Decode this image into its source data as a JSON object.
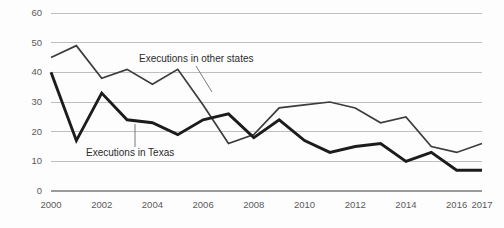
{
  "chart_data": {
    "type": "line",
    "title": "",
    "xlabel": "",
    "ylabel": "",
    "x": [
      2000,
      2001,
      2002,
      2003,
      2004,
      2005,
      2006,
      2007,
      2008,
      2009,
      2010,
      2011,
      2012,
      2013,
      2014,
      2015,
      2016,
      2017
    ],
    "xtick_labels": [
      "2000",
      "2002",
      "2004",
      "2006",
      "2008",
      "2010",
      "2012",
      "2014",
      "2016",
      "2017"
    ],
    "xtick_values": [
      2000,
      2002,
      2004,
      2006,
      2008,
      2010,
      2012,
      2014,
      2016,
      2017
    ],
    "ytick_labels": [
      "0",
      "10",
      "20",
      "30",
      "40",
      "50",
      "60"
    ],
    "ytick_values": [
      0,
      10,
      20,
      30,
      40,
      50,
      60
    ],
    "ylim": [
      0,
      60
    ],
    "xlim": [
      2000,
      2017
    ],
    "grid": true,
    "legend_position": "inline-annotations",
    "series": [
      {
        "name": "Executions in Texas",
        "color": "#1c1c1c",
        "line_width": "thick",
        "values": [
          40,
          17,
          33,
          24,
          23,
          19,
          24,
          26,
          18,
          24,
          17,
          13,
          15,
          16,
          10,
          13,
          7,
          7
        ]
      },
      {
        "name": "Executions in other states",
        "color": "#3c3c3c",
        "line_width": "thin",
        "values": [
          45,
          49,
          38,
          41,
          36,
          41,
          29,
          16,
          19,
          28,
          29,
          30,
          28,
          23,
          25,
          15,
          13,
          16
        ]
      }
    ],
    "annotations": [
      {
        "text": "Executions in other states",
        "target_year": 2006,
        "target_value": 36
      },
      {
        "text": "Executions in Texas",
        "target_year": 2004,
        "target_value": 23
      }
    ]
  }
}
